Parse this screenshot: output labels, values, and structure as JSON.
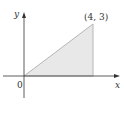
{
  "diagram": {
    "type": "shaded-triangle-region",
    "vertices": [
      [
        0,
        0
      ],
      [
        4,
        0
      ],
      [
        4,
        3
      ]
    ],
    "labels": {
      "x_axis": "x",
      "y_axis": "y",
      "origin": "0",
      "vertex": "(4, 3)"
    },
    "colors": {
      "fill": "#e8e8e8",
      "edge": "#b0b0b0",
      "axis": "#333333"
    }
  }
}
